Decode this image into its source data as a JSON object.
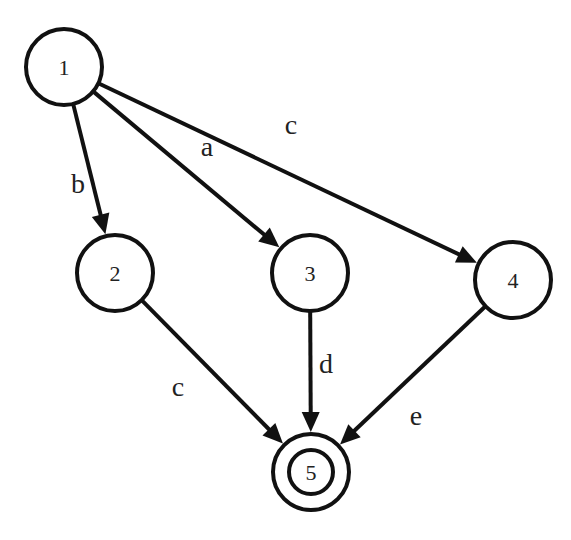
{
  "diagram": {
    "type": "state-transition-graph",
    "colors": {
      "stroke": "#111111",
      "background": "#ffffff",
      "text": "#222222"
    },
    "nodes": [
      {
        "id": "1",
        "label": "1",
        "cx": 64,
        "cy": 67,
        "r": 38,
        "accepting": false
      },
      {
        "id": "2",
        "label": "2",
        "cx": 115,
        "cy": 273,
        "r": 38,
        "accepting": false
      },
      {
        "id": "3",
        "label": "3",
        "cx": 310,
        "cy": 273,
        "r": 38,
        "accepting": false
      },
      {
        "id": "4",
        "label": "4",
        "cx": 513,
        "cy": 280,
        "r": 38,
        "accepting": false
      },
      {
        "id": "5",
        "label": "5",
        "cx": 311,
        "cy": 472,
        "r": 38,
        "accepting": true,
        "inner_r": 22
      }
    ],
    "edges": [
      {
        "from": "1",
        "to": "2",
        "label": "b",
        "lx": 78,
        "ly": 183
      },
      {
        "from": "1",
        "to": "3",
        "label": "a",
        "lx": 207,
        "ly": 146
      },
      {
        "from": "1",
        "to": "4",
        "label": "c",
        "lx": 291,
        "ly": 124
      },
      {
        "from": "2",
        "to": "5",
        "label": "c",
        "lx": 178,
        "ly": 386
      },
      {
        "from": "3",
        "to": "5",
        "label": "d",
        "lx": 326,
        "ly": 363
      },
      {
        "from": "4",
        "to": "5",
        "label": "e",
        "lx": 416,
        "ly": 415
      }
    ]
  }
}
